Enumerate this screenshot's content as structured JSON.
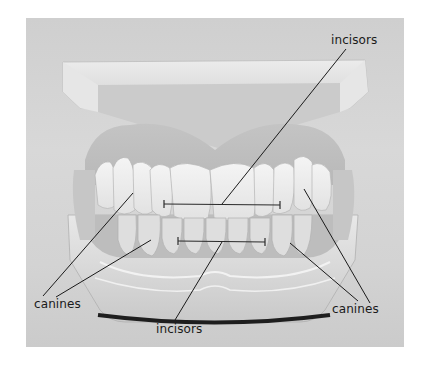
{
  "figure": {
    "frame": {
      "background": "#d3d3d3"
    },
    "labels": [
      {
        "id": "incisors-upper",
        "text": "incisors"
      },
      {
        "id": "canines-left",
        "text": "canines"
      },
      {
        "id": "incisors-lower",
        "text": "incisors"
      },
      {
        "id": "canines-right",
        "text": "canines"
      }
    ]
  }
}
